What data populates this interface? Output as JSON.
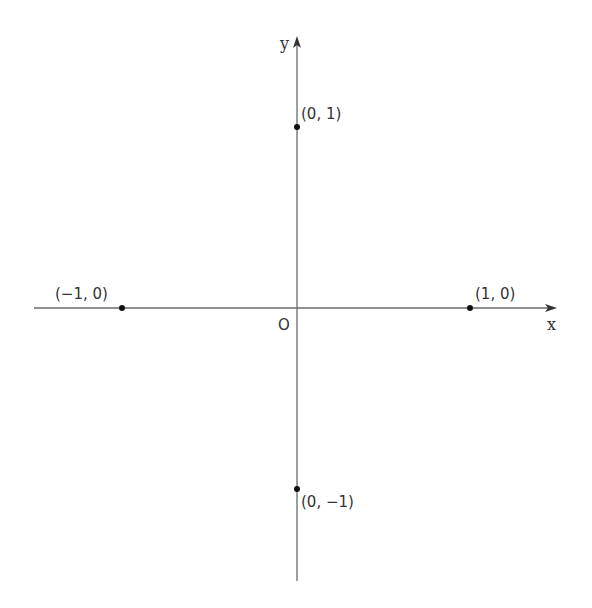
{
  "diagram": {
    "type": "coordinate-plane",
    "axes": {
      "x_label": "x",
      "y_label": "y",
      "origin_label": "O",
      "color": "#6b6b6b"
    },
    "points": [
      {
        "label": "(0, 1)",
        "x": 0,
        "y": 1
      },
      {
        "label": "(−1, 0)",
        "x": -1,
        "y": 0
      },
      {
        "label": "(1, 0)",
        "x": 1,
        "y": 0
      },
      {
        "label": "(0, −1)",
        "x": 0,
        "y": -1
      }
    ],
    "point_color": "#111111"
  }
}
